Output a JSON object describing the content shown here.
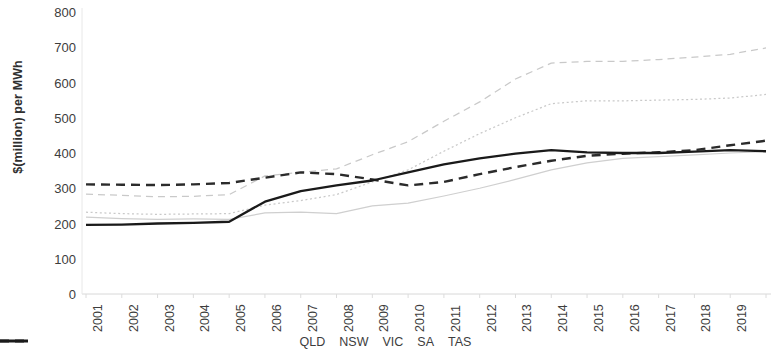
{
  "chart_data": {
    "type": "line",
    "title": "",
    "xlabel": "",
    "ylabel": "$(million) per MWh",
    "ylim": [
      0,
      800
    ],
    "yticks": [
      0,
      100,
      200,
      300,
      400,
      500,
      600,
      700,
      800
    ],
    "grid": false,
    "legend_position": "bottom",
    "categories": [
      "2001",
      "2002",
      "2003",
      "2004",
      "2005",
      "2006",
      "2007",
      "2008",
      "2009",
      "2010",
      "2011",
      "2012",
      "2013",
      "2014",
      "2015",
      "2016",
      "2017",
      "2018",
      "2019",
      "2020"
    ],
    "series": [
      {
        "name": "QLD",
        "style": "dashed",
        "color": "#c9c9c9",
        "values": [
          283,
          280,
          276,
          277,
          282,
          335,
          345,
          355,
          395,
          432,
          490,
          545,
          610,
          655,
          660,
          660,
          665,
          672,
          680,
          698
        ]
      },
      {
        "name": "NSW",
        "style": "dotted",
        "color": "#c9c9c9",
        "values": [
          232,
          228,
          226,
          227,
          228,
          252,
          265,
          282,
          318,
          352,
          405,
          455,
          500,
          540,
          548,
          548,
          550,
          552,
          556,
          566
        ]
      },
      {
        "name": "VIC",
        "style": "solid",
        "color": "#cfcfcf",
        "values": [
          218,
          214,
          212,
          213,
          212,
          230,
          232,
          228,
          250,
          258,
          278,
          300,
          325,
          352,
          372,
          385,
          390,
          395,
          400,
          404
        ]
      },
      {
        "name": "SA",
        "style": "dashed",
        "color": "#2b2b2b",
        "values": [
          311,
          310,
          309,
          311,
          315,
          330,
          345,
          340,
          325,
          308,
          318,
          340,
          360,
          378,
          392,
          398,
          402,
          408,
          422,
          435
        ]
      },
      {
        "name": "TAS",
        "style": "solid",
        "color": "#1a1a1a",
        "values": [
          196,
          197,
          200,
          202,
          205,
          262,
          292,
          308,
          322,
          345,
          368,
          385,
          398,
          408,
          402,
          400,
          400,
          404,
          408,
          405
        ]
      }
    ]
  },
  "axes": {
    "y_title": "$(million) per MWh",
    "y_tick_labels": [
      "800",
      "700",
      "600",
      "500",
      "400",
      "300",
      "200",
      "100",
      "0"
    ],
    "x_tick_labels": [
      "2001",
      "2002",
      "2003",
      "2004",
      "2005",
      "2006",
      "2007",
      "2008",
      "2009",
      "2010",
      "2011",
      "2012",
      "2013",
      "2014",
      "2015",
      "2016",
      "2017",
      "2018",
      "2019",
      "2020"
    ]
  },
  "legend": {
    "items": [
      {
        "label": "QLD"
      },
      {
        "label": "NSW"
      },
      {
        "label": "VIC"
      },
      {
        "label": "SA"
      },
      {
        "label": "TAS"
      }
    ]
  }
}
